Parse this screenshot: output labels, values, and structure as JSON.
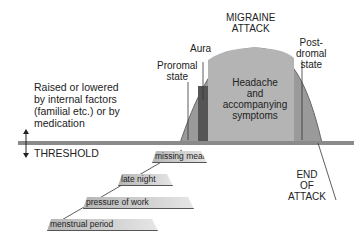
{
  "title": "MIGRAINE ATTACK",
  "title_lines": [
    "MIGRAINE",
    "ATTACK"
  ],
  "phases": {
    "prodromal": [
      "Proromal",
      "state"
    ],
    "aura": "Aura",
    "headache": [
      "Headache",
      "and",
      "accompanying",
      "symptoms"
    ],
    "postdromal": [
      "Post-",
      "dromal",
      "state"
    ]
  },
  "threshold": {
    "description_lines": [
      "Raised or lowered",
      "by internal factors",
      "(familial etc.) or by",
      "medication"
    ],
    "label": "THRESHOLD"
  },
  "triggers": [
    "missing meal",
    "late night",
    "pressure of work",
    "menstrual period"
  ],
  "end_label": [
    "END",
    "OF",
    "ATTACK"
  ],
  "colors": {
    "curve": "#8c8c8c",
    "headache_fill": "#a8a8a8",
    "aura_fill": "#555555",
    "threshold_bar": "#7a7a7a"
  }
}
